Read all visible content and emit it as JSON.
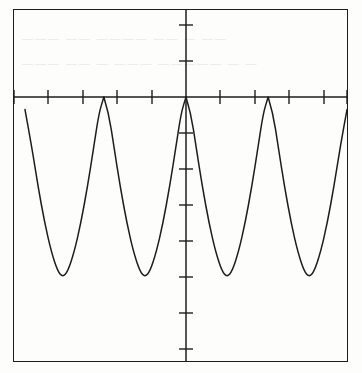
{
  "app": {
    "title": "Graphing Calculator Plot",
    "screen_label": "graph-screen"
  },
  "chart_data": {
    "type": "line",
    "title": "",
    "subtitle": "",
    "xlabel": "",
    "ylabel": "",
    "grid": false,
    "legend_position": "none",
    "xlim": [
      -4.9,
      4.9
    ],
    "ylim": [
      -7.6,
      2.1
    ],
    "x_axis": {
      "axis_y_value": 0,
      "tick_spacing": 1,
      "tick_count": 10,
      "tick_values": [
        -4,
        -3,
        -2,
        -1,
        1,
        2,
        3,
        4
      ],
      "tick_labels": []
    },
    "y_axis": {
      "axis_x_value": 0,
      "tick_spacing": 1,
      "tick_count": 9,
      "tick_values": [
        2,
        1,
        -1,
        -2,
        -3,
        -4,
        -5,
        -6,
        -7
      ],
      "tick_labels": []
    },
    "series": [
      {
        "name": "curve",
        "period": 2.5,
        "maxima_y": 0,
        "minima_y": -5.0,
        "cusp_x": [
          -5.0,
          -2.5,
          0,
          2.5,
          5.0
        ],
        "minima_x": [
          -3.75,
          -1.25,
          1.25,
          3.75
        ],
        "x": [
          -4.9,
          -4.7,
          -4.5,
          -4.3,
          -4.1,
          -3.9,
          -3.75,
          -3.6,
          -3.4,
          -3.2,
          -3.0,
          -2.8,
          -2.65,
          -2.5,
          -2.35,
          -2.2,
          -2.0,
          -1.8,
          -1.6,
          -1.4,
          -1.25,
          -1.1,
          -0.9,
          -0.7,
          -0.5,
          -0.3,
          -0.15,
          0,
          0.15,
          0.3,
          0.5,
          0.7,
          0.9,
          1.1,
          1.25,
          1.4,
          1.6,
          1.8,
          2.0,
          2.2,
          2.35,
          2.5,
          2.65,
          2.8,
          3.0,
          3.2,
          3.4,
          3.6,
          3.75,
          3.9,
          4.1,
          4.3,
          4.5,
          4.7,
          4.9
        ],
        "y": [
          -0.35,
          -1.35,
          -2.5,
          -3.5,
          -4.3,
          -4.85,
          -5.0,
          -4.85,
          -4.3,
          -3.5,
          -2.5,
          -1.35,
          -0.45,
          0,
          -0.45,
          -1.35,
          -2.5,
          -3.5,
          -4.3,
          -4.85,
          -5.0,
          -4.85,
          -4.3,
          -3.5,
          -2.5,
          -1.35,
          -0.45,
          0,
          -0.45,
          -1.35,
          -2.5,
          -3.5,
          -4.3,
          -4.85,
          -5.0,
          -4.85,
          -4.3,
          -3.5,
          -2.5,
          -1.35,
          -0.45,
          0,
          -0.45,
          -1.35,
          -2.5,
          -3.5,
          -4.3,
          -4.85,
          -5.0,
          -4.85,
          -4.3,
          -3.5,
          -2.5,
          -1.35,
          -0.35
        ]
      }
    ]
  },
  "style": {
    "curve_color": "#1d1d1d",
    "axis_color": "#1d1d1d",
    "frame_color": "#1d1d1d",
    "background_color": "#fdfdfc",
    "ghost_text_color": "#dedede"
  },
  "artifacts": {
    "ghost_rows": [
      "———  ——  ———— ——  — ——",
      "——— ——  —   ——— —————   — —"
    ]
  }
}
